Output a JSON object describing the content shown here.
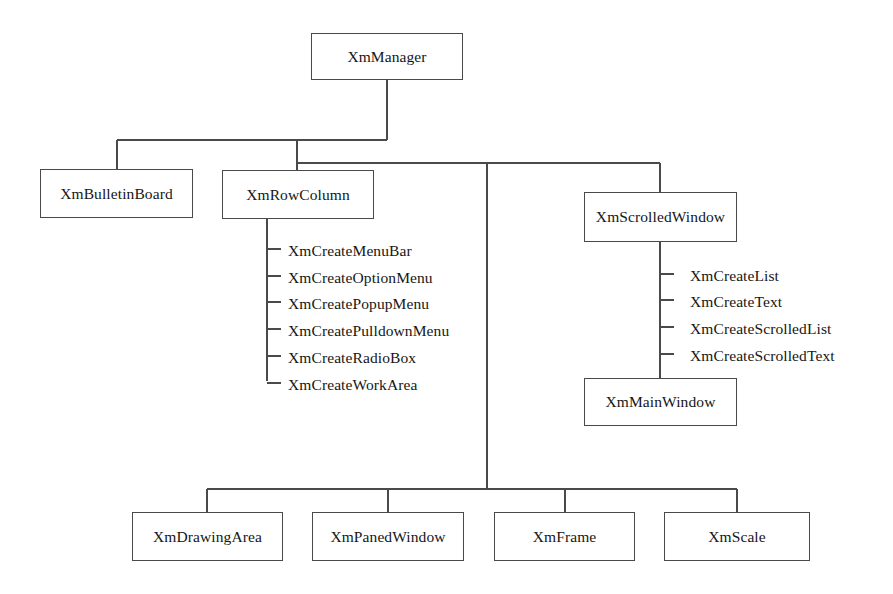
{
  "diagram": {
    "background_color": "#ffffff",
    "line_color": "#4a4a4a",
    "text_color": "#161616",
    "root": {
      "label": "XmManager",
      "x": 311,
      "y": 33,
      "w": 152,
      "h": 47
    },
    "boxes": [
      {
        "label": "XmBulletinBoard",
        "x": 40,
        "y": 169,
        "w": 153,
        "h": 49
      },
      {
        "label": "XmRowColumn",
        "x": 222,
        "y": 170,
        "w": 152,
        "h": 49
      },
      {
        "label": "XmScrolledWindow",
        "x": 584,
        "y": 192,
        "w": 153,
        "h": 50
      },
      {
        "label": "XmMainWindow",
        "x": 584,
        "y": 378,
        "w": 153,
        "h": 48
      },
      {
        "label": "XmDrawingArea",
        "x": 132,
        "y": 512,
        "w": 151,
        "h": 49
      },
      {
        "label": "XmPanedWindow",
        "x": 312,
        "y": 512,
        "w": 152,
        "h": 49
      },
      {
        "label": "XmFrame",
        "x": 494,
        "y": 512,
        "w": 141,
        "h": 49
      },
      {
        "label": "XmScale",
        "x": 664,
        "y": 512,
        "w": 146,
        "h": 49
      }
    ],
    "row_column_functions": [
      {
        "label": "XmCreateMenuBar",
        "x": 288,
        "y": 243
      },
      {
        "label": "XmCreateOptionMenu",
        "x": 288,
        "y": 270
      },
      {
        "label": "XmCreatePopupMenu",
        "x": 288,
        "y": 296
      },
      {
        "label": "XmCreatePulldownMenu",
        "x": 288,
        "y": 323
      },
      {
        "label": "XmCreateRadioBox",
        "x": 288,
        "y": 350
      },
      {
        "label": "XmCreateWorkArea",
        "x": 288,
        "y": 377
      }
    ],
    "scrolled_window_functions": [
      {
        "label": "XmCreateList",
        "x": 690,
        "y": 268
      },
      {
        "label": "XmCreateText",
        "x": 690,
        "y": 294
      },
      {
        "label": "XmCreateScrolledList",
        "x": 690,
        "y": 321
      },
      {
        "label": "XmCreateScrolledText",
        "x": 690,
        "y": 348
      }
    ],
    "wires": [
      {
        "name": "root-stem-down",
        "x1": 387,
        "y1": 80,
        "x2": 387,
        "y2": 140
      },
      {
        "name": "tier1-bus",
        "x1": 117,
        "y1": 140,
        "x2": 387,
        "y2": 140
      },
      {
        "name": "bulletinboard-drop",
        "x1": 117,
        "y1": 140,
        "x2": 117,
        "y2": 169
      },
      {
        "name": "tier1-to-tier2-drop",
        "x1": 297,
        "y1": 140,
        "x2": 297,
        "y2": 163
      },
      {
        "name": "tier2-bus",
        "x1": 297,
        "y1": 163,
        "x2": 660,
        "y2": 163
      },
      {
        "name": "rowcolumn-drop",
        "x1": 297,
        "y1": 163,
        "x2": 297,
        "y2": 170
      },
      {
        "name": "scrolledwindow-drop",
        "x1": 660,
        "y1": 163,
        "x2": 660,
        "y2": 192
      },
      {
        "name": "main-trunk-down",
        "x1": 487,
        "y1": 163,
        "x2": 487,
        "y2": 489
      },
      {
        "name": "rowcolumn-list-spine",
        "x1": 267,
        "y1": 219,
        "x2": 267,
        "y2": 381
      },
      {
        "name": "scrolled-list-spine",
        "x1": 660,
        "y1": 242,
        "x2": 660,
        "y2": 378
      },
      {
        "name": "bottom-bus",
        "x1": 207,
        "y1": 489,
        "x2": 737,
        "y2": 489
      },
      {
        "name": "drawingarea-drop",
        "x1": 207,
        "y1": 489,
        "x2": 207,
        "y2": 512
      },
      {
        "name": "panedwindow-drop",
        "x1": 388,
        "y1": 489,
        "x2": 388,
        "y2": 512
      },
      {
        "name": "frame-drop",
        "x1": 565,
        "y1": 489,
        "x2": 565,
        "y2": 512
      },
      {
        "name": "scale-drop",
        "x1": 737,
        "y1": 489,
        "x2": 737,
        "y2": 512
      }
    ],
    "tick_length": 14
  }
}
